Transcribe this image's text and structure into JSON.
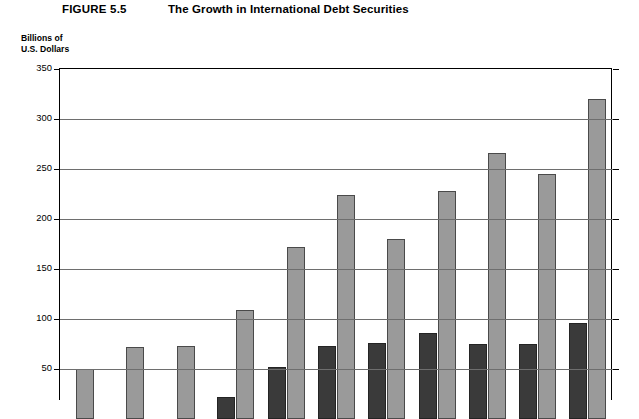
{
  "header": {
    "figure_label": "FIGURE 5.5",
    "title": "The Growth in International Debt Securities"
  },
  "axis": {
    "y_caption": "Billions of\nU.S. Dollars",
    "y_ticks": [
      50,
      100,
      150,
      200,
      250,
      300,
      350
    ]
  },
  "chart_data": {
    "type": "bar",
    "title": "The Growth in International Debt Securities",
    "xlabel": "",
    "ylabel": "Billions of U.S. Dollars",
    "ylim": [
      0,
      350
    ],
    "ytick_step": 50,
    "grid": true,
    "legend": "none",
    "categories": [
      "1",
      "2",
      "3",
      "4",
      "5",
      "6",
      "7",
      "8",
      "9",
      "10",
      "11"
    ],
    "series": [
      {
        "name": "dark-series",
        "color": "#3a3a3a",
        "values": [
          null,
          null,
          null,
          22,
          52,
          73,
          76,
          86,
          75,
          75,
          96
        ]
      },
      {
        "name": "light-series",
        "color": "#9a9a9a",
        "values": [
          50,
          72,
          73,
          109,
          172,
          224,
          180,
          228,
          266,
          245,
          320
        ]
      }
    ]
  }
}
